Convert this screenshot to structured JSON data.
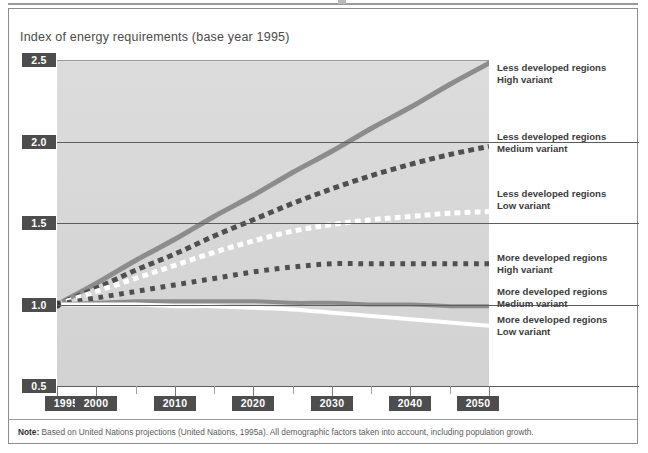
{
  "figure": {
    "title": "Index of energy requirements (base year 1995)",
    "footnote_label": "Note:",
    "footnote_text": " Based on United Nations projections (United Nations, 1995a). All demographic factors taken into account, including population growth."
  },
  "colors": {
    "plot_background": "#d8d8d8",
    "page_background": "#ffffff",
    "chip_background": "#4d4d4d",
    "chip_text": "#ffffff",
    "gridline": "#5d5d5d",
    "series_dark": "#4f4f4f",
    "series_gray": "#8c8c8c",
    "series_white": "#ffffff",
    "title_text": "#4a4a4a",
    "legend_text": "#3c3c3c",
    "frame_border": "#8d8d8d"
  },
  "axes": {
    "y_ticks": [
      "2.5",
      "2.0",
      "1.5",
      "1.0",
      "0.5"
    ],
    "y_values": [
      2.5,
      2.0,
      1.5,
      1.0,
      0.5
    ],
    "x_ticks": [
      "1995",
      "2000",
      "2010",
      "2020",
      "2030",
      "2040",
      "2050"
    ],
    "x_values": [
      1995,
      2000,
      2010,
      2020,
      2030,
      2040,
      2050
    ],
    "x_minor_values": [
      2005,
      2015,
      2025,
      2035,
      2045
    ]
  },
  "legend": [
    {
      "line1": "Less developed regions",
      "line2": "High variant",
      "style": "solid-gray",
      "key": "ldr-high"
    },
    {
      "line1": "Less developed regions",
      "line2": "Medium variant",
      "style": "dashed-dark",
      "key": "ldr-medium"
    },
    {
      "line1": "Less developed regions",
      "line2": "Low variant",
      "style": "dashed-white",
      "key": "ldr-low"
    },
    {
      "line1": "More developed regions",
      "line2": "High variant",
      "style": "dotted-dark",
      "key": "mdr-high"
    },
    {
      "line1": "More developed regions",
      "line2": "Medium variant",
      "style": "solid-gray",
      "key": "mdr-medium"
    },
    {
      "line1": "More developed regions",
      "line2": "Low variant",
      "style": "solid-white",
      "key": "mdr-low"
    }
  ],
  "chart_data": {
    "type": "line",
    "title": "Index of energy requirements (base year 1995)",
    "xlabel": "",
    "ylabel": "Index of energy requirements (base year 1995)",
    "xlim": [
      1995,
      2050
    ],
    "ylim": [
      0.5,
      2.5
    ],
    "grid": true,
    "legend_position": "right",
    "x": [
      1995,
      2000,
      2005,
      2010,
      2015,
      2020,
      2025,
      2030,
      2035,
      2040,
      2045,
      2050
    ],
    "series": [
      {
        "name": "Less developed regions High variant",
        "style": "solid",
        "color": "#8c8c8c",
        "width": 5,
        "values": [
          1.0,
          1.13,
          1.27,
          1.4,
          1.54,
          1.67,
          1.81,
          1.94,
          2.08,
          2.21,
          2.35,
          2.48
        ]
      },
      {
        "name": "Less developed regions Medium variant",
        "style": "dashed",
        "color": "#4f4f4f",
        "width": 5,
        "values": [
          1.0,
          1.1,
          1.21,
          1.31,
          1.42,
          1.52,
          1.62,
          1.71,
          1.79,
          1.86,
          1.92,
          1.97
        ]
      },
      {
        "name": "Less developed regions Low variant",
        "style": "dashed",
        "color": "#ffffff",
        "width": 5,
        "values": [
          1.0,
          1.08,
          1.16,
          1.24,
          1.32,
          1.39,
          1.45,
          1.49,
          1.52,
          1.54,
          1.56,
          1.57
        ]
      },
      {
        "name": "More developed regions High variant",
        "style": "dotted",
        "color": "#4f4f4f",
        "width": 5,
        "values": [
          1.0,
          1.04,
          1.08,
          1.12,
          1.16,
          1.2,
          1.23,
          1.25,
          1.25,
          1.25,
          1.25,
          1.25
        ]
      },
      {
        "name": "More developed regions Medium variant",
        "style": "solid",
        "color": "#8c8c8c",
        "width": 4,
        "values": [
          1.0,
          1.01,
          1.02,
          1.02,
          1.02,
          1.02,
          1.01,
          1.01,
          1.0,
          1.0,
          0.99,
          0.99
        ]
      },
      {
        "name": "More developed regions Low variant",
        "style": "solid",
        "color": "#ffffff",
        "width": 4,
        "values": [
          1.0,
          1.0,
          1.0,
          0.99,
          0.99,
          0.98,
          0.97,
          0.95,
          0.93,
          0.91,
          0.89,
          0.87
        ]
      }
    ]
  }
}
